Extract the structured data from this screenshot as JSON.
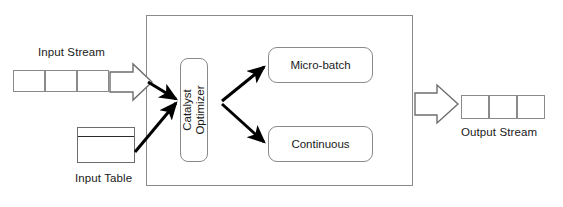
{
  "diagram": {
    "title_present": false,
    "colors": {
      "background": "#ffffff",
      "box_stroke": "#8a8a8a",
      "arrow_fill": "#000000",
      "hollow_arrow_stroke": "#6d6d6d",
      "text": "#1a1a1a"
    },
    "input_stream": {
      "label": "Input Stream",
      "cell_count": 3,
      "cells": [
        "",
        "",
        ""
      ]
    },
    "input_table": {
      "label": "Input Table",
      "has_header_row": true
    },
    "engine": {
      "optimizer": {
        "line1": "Catalyst",
        "line2": "Optimizer",
        "orientation": "vertical"
      },
      "modes": [
        {
          "label": "Micro-batch"
        },
        {
          "label": "Continuous"
        }
      ]
    },
    "output_stream": {
      "label": "Output Stream",
      "cell_count": 3,
      "cells": [
        "",
        "",
        ""
      ]
    },
    "arrows": {
      "input_stream_to_engine": "hollow-right-arrow",
      "engine_to_output": "hollow-right-arrow",
      "stream_to_optimizer": "solid-arrow",
      "table_to_optimizer": "solid-arrow",
      "optimizer_to_microbatch": "solid-arrow",
      "optimizer_to_continuous": "solid-arrow"
    }
  }
}
